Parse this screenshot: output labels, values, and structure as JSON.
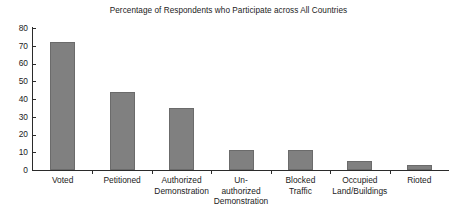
{
  "chart_data": {
    "type": "bar",
    "title": "Percentage of Respondents who Participate across All Countries",
    "xlabel": "",
    "ylabel": "",
    "ylim": [
      0,
      80
    ],
    "yticks": [
      0,
      10,
      20,
      30,
      40,
      50,
      60,
      70,
      80
    ],
    "grid": false,
    "legend": null,
    "bar_color": "#808080",
    "bar_border_color": "#6b6b6b",
    "axis_color": "#2b2b2b",
    "categories": [
      "Voted",
      "Petitioned",
      "Authorized Demonstration",
      "Un-authorized Demonstration",
      "Blocked Traffic",
      "Occupied Land/Buildings",
      "Rioted"
    ],
    "category_lines": [
      [
        "Voted"
      ],
      [
        "Petitioned"
      ],
      [
        "Authorized",
        "Demonstration"
      ],
      [
        "Un-",
        "authorized",
        "Demonstration"
      ],
      [
        "Blocked",
        "Traffic"
      ],
      [
        "Occupied",
        "Land/Buildings"
      ],
      [
        "Rioted"
      ]
    ],
    "values": [
      72,
      44,
      35,
      11,
      11,
      5,
      3
    ]
  }
}
